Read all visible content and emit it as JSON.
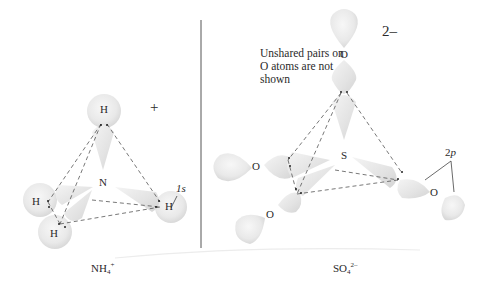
{
  "figure": {
    "left_panel": {
      "molecule": "NH4+",
      "caption": {
        "base": "NH",
        "subscript": "4",
        "superscript": "+"
      },
      "charge": "+",
      "central_atom": "N",
      "atoms": [
        "H",
        "H",
        "H",
        "H"
      ],
      "orbital_label": "1s"
    },
    "right_panel": {
      "molecule": "SO4 2-",
      "caption": {
        "base": "SO",
        "subscript": "4",
        "superscript": "2–"
      },
      "charge": "2–",
      "central_atom": "S",
      "atoms": [
        "O",
        "O",
        "O",
        "O"
      ],
      "orbital_label_base": "2",
      "orbital_label_italic": "p",
      "note": "Unshared pairs on O atoms are not shown"
    },
    "colors": {
      "orbital_fill": "#e6e6e6",
      "orbital_edge": "#d2d2d2",
      "dashed_line": "#555555",
      "divider": "#555555",
      "text": "#2a2a2a"
    }
  }
}
